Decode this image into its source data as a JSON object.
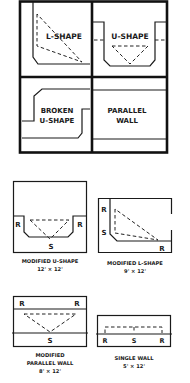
{
  "colors": {
    "ink": "#1a1a1a",
    "background": "#ffffff"
  },
  "top_grid": {
    "cells": [
      {
        "name": "l-shape",
        "label": "L-SHAPE"
      },
      {
        "name": "u-shape",
        "label": "U-SHAPE"
      },
      {
        "name": "broken-u-shape",
        "label_line1": "BROKEN",
        "label_line2": "U-SHAPE"
      },
      {
        "name": "parallel-wall",
        "label_line1": "PARALLEL",
        "label_line2": "WALL"
      }
    ]
  },
  "plans": [
    {
      "name": "modified-u-shape",
      "title": "MODIFIED U-SHAPE",
      "dimensions": "12' × 12'",
      "marks": [
        "R",
        "R",
        "S"
      ]
    },
    {
      "name": "modified-l-shape",
      "title": "MODIFIED L-SHAPE",
      "dimensions": "9' × 12'",
      "marks": [
        "R",
        "S",
        "R"
      ]
    },
    {
      "name": "modified-parallel-wall",
      "title_line1": "MODIFIED",
      "title_line2": "PARALLEL WALL",
      "dimensions": "8' × 12'",
      "marks": [
        "R",
        "R",
        "S"
      ]
    },
    {
      "name": "single-wall",
      "title": "SINGLE WALL",
      "dimensions": "5' × 12'",
      "marks": [
        "R",
        "S",
        "R"
      ]
    }
  ]
}
